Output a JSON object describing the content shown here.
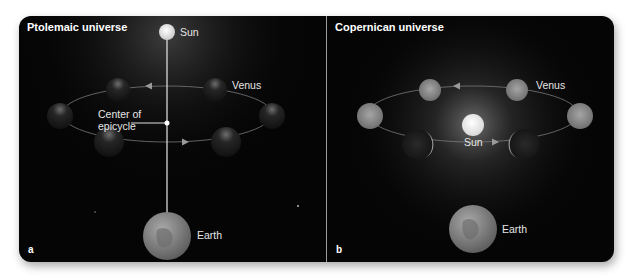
{
  "figure": {
    "panels": [
      {
        "id": "a",
        "title": "Ptolemaic universe",
        "letter": "a",
        "labels": {
          "sun": "Sun",
          "venus": "Venus",
          "center_line1": "Center of",
          "center_line2": "epicycle",
          "earth": "Earth"
        }
      },
      {
        "id": "b",
        "title": "Copernican universe",
        "letter": "b",
        "labels": {
          "sun": "Sun",
          "venus": "Venus",
          "earth": "Earth"
        }
      }
    ],
    "colors": {
      "background": "#050505",
      "text": "#ffffff",
      "orbit": "#8a8a8a",
      "divider": "#9a9a9a"
    }
  }
}
